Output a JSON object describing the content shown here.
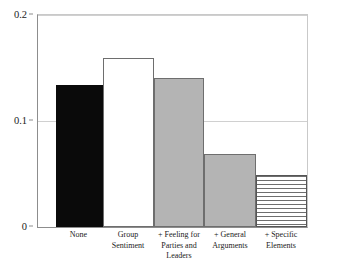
{
  "chart_data": {
    "type": "bar",
    "title": "",
    "subtitle": "",
    "xlabel": "",
    "ylabel": "",
    "categories": [
      "None",
      "Group Sentiment",
      "+ Feeling for Parties and Leaders",
      "+ General Arguments",
      "+ Specific Elements"
    ],
    "category_lines": [
      [
        "None"
      ],
      [
        "Group",
        "Sentiment"
      ],
      [
        "+ Feeling for",
        "Parties and",
        "Leaders"
      ],
      [
        "+ General",
        "Arguments"
      ],
      [
        "+ Specific",
        "Elements"
      ]
    ],
    "values": [
      0.134,
      0.159,
      0.141,
      0.069,
      0.049
    ],
    "bar_styles": [
      "black",
      "white",
      "gray",
      "gray",
      "horizontal-lines"
    ],
    "ylim": [
      0,
      0.2
    ],
    "yticks": [
      0,
      0.1,
      0.2
    ],
    "ytick_labels": [
      "0",
      "0.1",
      "0.2"
    ],
    "grid": true,
    "grid_axis": "y",
    "legend": "none",
    "colors": {
      "black_bar": "#0a0a0a",
      "white_bar": "#ffffff",
      "gray_bar": "#b4b4b4",
      "bar_outline": "#6e6e6e",
      "gridline": "#d0d0d0",
      "axis": "#8d8d8d",
      "background": "#ffffff",
      "text": "#1a1a1a"
    }
  }
}
